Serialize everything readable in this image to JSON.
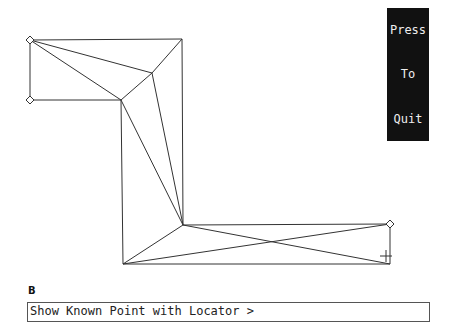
{
  "quit_button": {
    "lines": [
      "Press",
      "To",
      "Quit"
    ]
  },
  "figure_label": "B",
  "command_line": {
    "text": "Show Known Point with Locator >"
  },
  "mesh": {
    "stroke": "#333",
    "nodes": {
      "A": [
        30,
        40
      ],
      "B": [
        182,
        39
      ],
      "C": [
        152,
        73
      ],
      "D": [
        30,
        100
      ],
      "E": [
        121,
        100
      ],
      "F": [
        183,
        225
      ],
      "G": [
        123,
        264
      ],
      "H": [
        390,
        224
      ],
      "I": [
        390,
        264
      ]
    },
    "edges": [
      [
        "A",
        "B"
      ],
      [
        "A",
        "C"
      ],
      [
        "A",
        "E"
      ],
      [
        "A",
        "D"
      ],
      [
        "D",
        "E"
      ],
      [
        "B",
        "C"
      ],
      [
        "C",
        "E"
      ],
      [
        "B",
        "F"
      ],
      [
        "C",
        "F"
      ],
      [
        "E",
        "F"
      ],
      [
        "E",
        "G"
      ],
      [
        "F",
        "G"
      ],
      [
        "F",
        "H"
      ],
      [
        "G",
        "I"
      ],
      [
        "H",
        "I"
      ],
      [
        "G",
        "H"
      ],
      [
        "F",
        "I"
      ]
    ],
    "markers_diamond": [
      "A",
      "D",
      "H"
    ],
    "marker_cross": [
      386,
      256
    ]
  }
}
